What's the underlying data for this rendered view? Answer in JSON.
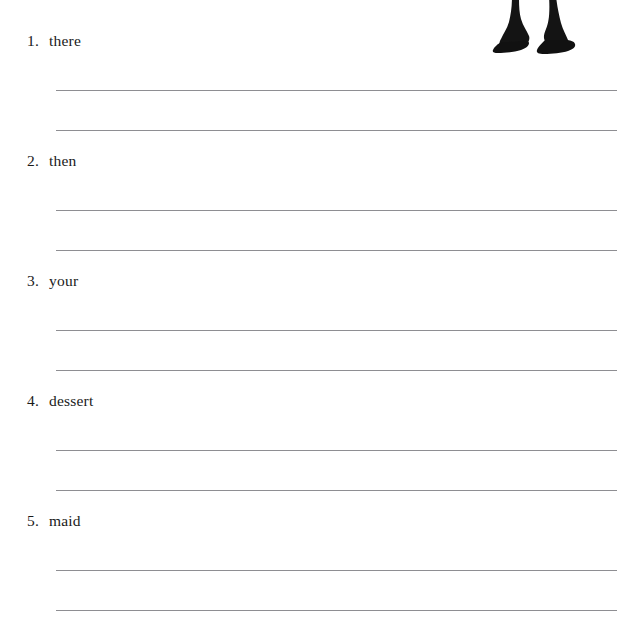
{
  "document": {
    "type": "worksheet",
    "background_color": "#ffffff",
    "text_color": "#1a1a1a",
    "rule_color": "#8e8e92"
  },
  "illustration": {
    "name": "legs-with-shoes-illustration",
    "description": "cropped line-art of two legs wearing shoes",
    "color": "#111111"
  },
  "exercises": [
    {
      "number": "1.",
      "word": "there",
      "lines": 2
    },
    {
      "number": "2.",
      "word": "then",
      "lines": 2
    },
    {
      "number": "3.",
      "word": "your",
      "lines": 2
    },
    {
      "number": "4.",
      "word": "dessert",
      "lines": 2
    },
    {
      "number": "5.",
      "word": "maid",
      "lines": 2
    }
  ]
}
